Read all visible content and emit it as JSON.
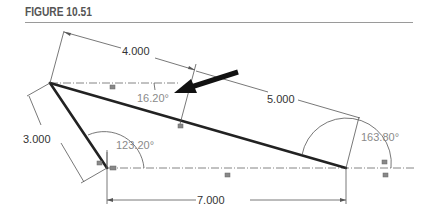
{
  "figure": {
    "title": "FIGURE 10.51"
  },
  "dimensions": {
    "top_left_length": "4.000",
    "top_right_length": "5.000",
    "left_length": "3.000",
    "bottom_length": "7.000"
  },
  "angles": {
    "top_angle": "16.20°",
    "bottom_left_angle": "123.20°",
    "right_angle": "163.80°"
  },
  "colors": {
    "geometry": "#222222",
    "dimension": "#555555",
    "angle_text": "#8a8a8a",
    "title": "#555555"
  }
}
